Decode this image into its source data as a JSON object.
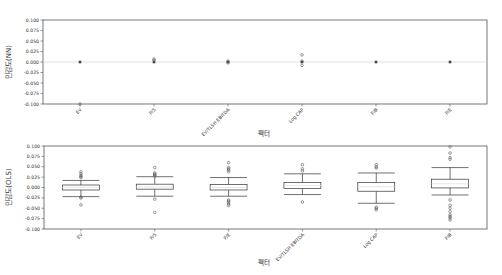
{
  "chart_data": [
    {
      "type": "boxplot",
      "title": "",
      "xlabel": "팩터",
      "ylabel": "민감도(NN)",
      "ylim": [
        -0.1,
        0.1
      ],
      "yticks": [
        "0.100",
        "0.075",
        "0.050",
        "0.025",
        "0.000",
        "-0.025",
        "-0.050",
        "-0.075",
        "-0.100"
      ],
      "grid": false,
      "categories": [
        "EV",
        "P/S",
        "EV/TLSH EBITDA",
        "Log CAP",
        "P/B",
        "P/E"
      ],
      "series": [
        {
          "name": "EV",
          "q1": 0.0,
          "median": 0.0,
          "q3": 0.0,
          "whisker_low": 0.0,
          "whisker_high": 0.0,
          "outliers": [
            -0.1
          ]
        },
        {
          "name": "P/S",
          "q1": 0.0,
          "median": 0.0,
          "q3": 0.0,
          "whisker_low": 0.0,
          "whisker_high": 0.0,
          "outliers": [
            0.004,
            0.007
          ]
        },
        {
          "name": "EV/TLSH EBITDA",
          "q1": 0.0,
          "median": 0.0,
          "q3": 0.0,
          "whisker_low": 0.0,
          "whisker_high": 0.0,
          "outliers": [
            -0.002,
            0.002
          ]
        },
        {
          "name": "Log CAP",
          "q1": 0.0,
          "median": 0.0,
          "q3": 0.0,
          "whisker_low": 0.0,
          "whisker_high": 0.0,
          "outliers": [
            0.017,
            0.002,
            -0.008
          ]
        },
        {
          "name": "P/B",
          "q1": 0.0,
          "median": 0.0,
          "q3": 0.0,
          "whisker_low": 0.0,
          "whisker_high": 0.0,
          "outliers": []
        },
        {
          "name": "P/E",
          "q1": 0.0,
          "median": 0.0,
          "q3": 0.0,
          "whisker_low": 0.0,
          "whisker_high": 0.0,
          "outliers": []
        }
      ]
    },
    {
      "type": "boxplot",
      "title": "",
      "xlabel": "팩터",
      "ylabel": "민감도(OLS)",
      "ylim": [
        -0.1,
        0.1
      ],
      "yticks": [
        "0.100",
        "0.075",
        "0.050",
        "0.025",
        "0.000",
        "-0.025",
        "-0.050",
        "-0.075",
        "-0.100"
      ],
      "grid": false,
      "categories": [
        "EV",
        "P/S",
        "P/E",
        "EV/TLSH EBITDA",
        "Log CAP",
        "P/B"
      ],
      "series": [
        {
          "name": "EV",
          "q1": -0.006,
          "median": 0.0,
          "q3": 0.006,
          "whisker_low": -0.022,
          "whisker_high": 0.017,
          "outliers": [
            0.038,
            0.033,
            0.029,
            0.026,
            0.024,
            -0.025,
            -0.023,
            -0.042
          ]
        },
        {
          "name": "P/S",
          "q1": -0.004,
          "median": 0.001,
          "q3": 0.008,
          "whisker_low": -0.021,
          "whisker_high": 0.026,
          "outliers": [
            0.048,
            0.035,
            0.032,
            0.03,
            0.028,
            -0.028,
            -0.06
          ]
        },
        {
          "name": "P/E",
          "q1": -0.006,
          "median": 0.0,
          "q3": 0.007,
          "whisker_low": -0.021,
          "whisker_high": 0.024,
          "outliers": [
            0.06,
            0.048,
            0.045,
            0.042,
            0.038,
            -0.03,
            -0.033,
            -0.036,
            -0.04,
            -0.043
          ]
        },
        {
          "name": "EV/TLSH EBITDA",
          "q1": -0.002,
          "median": 0.005,
          "q3": 0.012,
          "whisker_low": -0.017,
          "whisker_high": 0.033,
          "outliers": [
            0.055,
            0.045,
            0.04,
            -0.035
          ]
        },
        {
          "name": "Log CAP",
          "q1": -0.009,
          "median": 0.002,
          "q3": 0.012,
          "whisker_low": -0.038,
          "whisker_high": 0.035,
          "outliers": [
            0.055,
            0.05,
            0.047,
            -0.048,
            -0.05,
            -0.054
          ]
        },
        {
          "name": "P/B",
          "q1": -0.001,
          "median": 0.009,
          "q3": 0.02,
          "whisker_low": -0.018,
          "whisker_high": 0.048,
          "outliers": [
            0.098,
            0.083,
            0.072,
            0.068,
            -0.03,
            -0.043,
            -0.05,
            -0.058,
            -0.066,
            -0.07,
            -0.073,
            -0.078
          ]
        }
      ]
    }
  ],
  "ui": {
    "top_ylabel": "민감도(NN)",
    "bottom_ylabel": "민감도(OLS)",
    "top_xlabel": "팩터",
    "bottom_xlabel": "팩터"
  }
}
